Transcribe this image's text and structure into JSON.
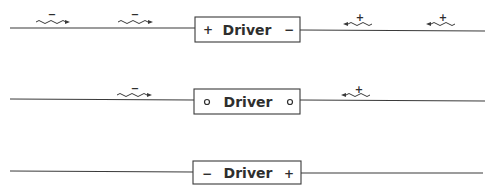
{
  "diagram": {
    "rows": [
      {
        "label": "Driver",
        "left_terminal": "+",
        "right_terminal": "−",
        "carriers": [
          {
            "charge": "−",
            "direction": "right",
            "side": "left"
          },
          {
            "charge": "−",
            "direction": "right",
            "side": "left"
          },
          {
            "charge": "+",
            "direction": "left",
            "side": "right"
          },
          {
            "charge": "+",
            "direction": "left",
            "side": "right"
          }
        ]
      },
      {
        "label": "Driver",
        "left_terminal": "∘",
        "right_terminal": "∘",
        "carriers": [
          {
            "charge": "−",
            "direction": "right",
            "side": "left"
          },
          {
            "charge": "+",
            "direction": "left",
            "side": "right"
          }
        ]
      },
      {
        "label": "Driver",
        "left_terminal": "−",
        "right_terminal": "+",
        "carriers": []
      }
    ]
  }
}
